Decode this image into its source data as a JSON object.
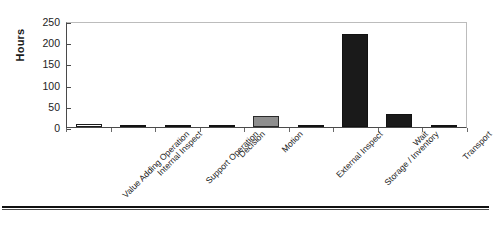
{
  "chart_data": {
    "type": "bar",
    "title": "",
    "subtitle": "",
    "xlabel": "",
    "ylabel": "Hours",
    "ylim": [
      0,
      250
    ],
    "yticks": [
      250,
      200,
      150,
      100,
      50,
      0
    ],
    "grid": false,
    "legend": false,
    "categories": [
      "Value Adding Operation",
      "Internal Inspect",
      "Support Operation",
      "Decision",
      "Motion",
      "External Inspect",
      "Storage / Inventory",
      "Wait",
      "Transport"
    ],
    "values": [
      8,
      0,
      2,
      2,
      25,
      3,
      220,
      30,
      1
    ],
    "bar_styles": [
      "open",
      "dark",
      "dark",
      "dark",
      "gray",
      "dark",
      "dark",
      "dark",
      "dark"
    ],
    "colors": {
      "open_fill": "#ffffff",
      "gray_fill": "#8e8e8e",
      "dark_fill": "#1a1a1a",
      "outline": "#1c1c1c",
      "axis": "#4a4a4a",
      "frame": "#bcbcbc",
      "text": "#232323"
    }
  },
  "figure": {
    "axis_title": "Hours",
    "bottom_rule": ""
  }
}
